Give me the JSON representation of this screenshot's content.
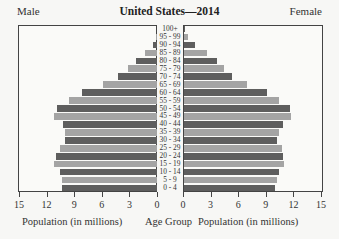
{
  "header": {
    "title": "United States—2014",
    "left_label": "Male",
    "right_label": "Female"
  },
  "axes": {
    "male_ticks": [
      "15",
      "12",
      "9",
      "6",
      "3",
      "0"
    ],
    "female_ticks": [
      "0",
      "3",
      "6",
      "9",
      "12",
      "15"
    ],
    "left_xlabel": "Population (in millions)",
    "center_label": "Age Group",
    "right_xlabel": "Population (in millions)"
  },
  "colors": {
    "dark_bar": "#5e5e5e",
    "light_bar": "#a4a4a4",
    "frame": "#444444"
  },
  "chart_data": {
    "type": "bar",
    "orientation": "horizontal",
    "subtype": "population-pyramid",
    "title": "United States—2014",
    "xlabel": "Population (in millions)",
    "ylabel": "Age Group",
    "xlim": [
      0,
      15
    ],
    "categories": [
      "100+",
      "95 - 99",
      "90 - 94",
      "85 - 89",
      "80 - 84",
      "75 - 79",
      "70 - 74",
      "65 - 69",
      "60 - 64",
      "55 - 59",
      "50 - 54",
      "45 - 49",
      "40 - 44",
      "35 - 39",
      "30 - 34",
      "25 - 29",
      "20 - 24",
      "15 - 19",
      "10 - 14",
      "5 - 9",
      "0 - 4"
    ],
    "series": [
      {
        "name": "Male",
        "values": [
          0.0,
          0.1,
          0.4,
          1.3,
          2.3,
          3.2,
          4.2,
          5.9,
          8.1,
          9.6,
          10.9,
          11.2,
          10.2,
          10.0,
          10.0,
          10.5,
          11.0,
          11.2,
          10.5,
          10.3,
          10.3
        ]
      },
      {
        "name": "Female",
        "values": [
          0.1,
          0.4,
          1.2,
          2.5,
          3.6,
          4.3,
          5.2,
          6.8,
          9.0,
          10.3,
          11.5,
          11.6,
          10.8,
          10.3,
          10.1,
          10.7,
          10.8,
          10.9,
          10.3,
          10.1,
          9.9
        ]
      }
    ],
    "legend": [
      "Male (left)",
      "Female (right)"
    ],
    "grid": false
  }
}
